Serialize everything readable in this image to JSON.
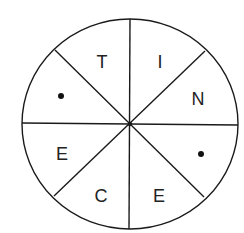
{
  "diagram": {
    "type": "divided-circle",
    "sector_count": 8,
    "sectors": [
      {
        "position": "top-left",
        "content": "T",
        "kind": "letter"
      },
      {
        "position": "top-right",
        "content": "I",
        "kind": "letter"
      },
      {
        "position": "right-upper",
        "content": "N",
        "kind": "letter"
      },
      {
        "position": "right-lower",
        "content": "•",
        "kind": "dot"
      },
      {
        "position": "bottom-right",
        "content": "E",
        "kind": "letter"
      },
      {
        "position": "bottom-left",
        "content": "C",
        "kind": "letter"
      },
      {
        "position": "left-lower",
        "content": "E",
        "kind": "letter"
      },
      {
        "position": "left-upper",
        "content": "•",
        "kind": "dot"
      }
    ],
    "colors": {
      "stroke": "#1a1a1a",
      "text": "#222222",
      "background": "#ffffff"
    }
  }
}
